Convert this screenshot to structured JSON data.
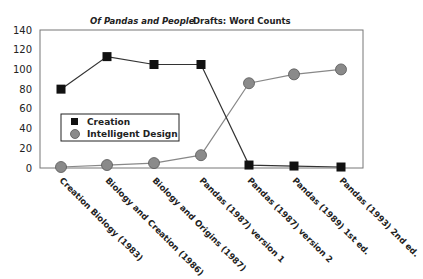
{
  "chart_data": {
    "type": "line",
    "title_italic": "Of Pandas and People",
    "title_rest": "Drafts: Word Counts",
    "title": "Of Pandas and People   Drafts: Word Counts",
    "xlabel": "",
    "ylabel": "",
    "ylim": [
      0,
      140
    ],
    "yticks": [
      0,
      20,
      40,
      60,
      80,
      100,
      120,
      140
    ],
    "grid": false,
    "legend_position": "inside-left-middle",
    "categories": [
      "Creation Biology (1983)",
      "Biology and Creation (1986)",
      "Biology and Origins (1987)",
      "Pandas (1987) version 1",
      "Pandas (1987) version 2",
      "Pandas (1989) 1st ed.",
      "Pandas (1993) 2nd ed."
    ],
    "series": [
      {
        "name": "Creation",
        "marker": "square",
        "color": "#111111",
        "line_color": "#333333",
        "values": [
          80,
          113,
          105,
          105,
          3,
          2,
          1
        ]
      },
      {
        "name": "Intelligent Design",
        "marker": "circle",
        "color": "#8a8a8a",
        "line_color": "#888888",
        "values": [
          1,
          3,
          5,
          13,
          86,
          95,
          100
        ]
      }
    ]
  },
  "legend": {
    "items": [
      "Creation",
      "Intelligent Design"
    ]
  }
}
